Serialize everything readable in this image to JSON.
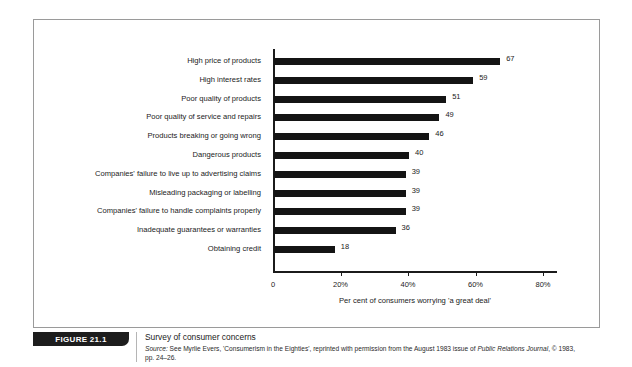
{
  "figure": {
    "badge_label": "FIGURE 21.1",
    "title": "Survey of consumer concerns",
    "source_prefix": "Source:",
    "source_text_1": " See Myrlie Evers, 'Consumerism in the Eighties', reprinted with permission from the August 1983 issue of ",
    "source_italic_journal": "Public Relations Journal",
    "source_text_2": ", © 1983,",
    "source_text_3": "pp. 24–26."
  },
  "chart_data": {
    "type": "bar",
    "orientation": "horizontal",
    "title": "Survey of consumer concerns",
    "xlabel": "Per cent of consumers worrying 'a great deal'",
    "ylabel": "",
    "xlim": [
      0,
      84
    ],
    "grid": false,
    "legend": false,
    "bar_color": "#141414",
    "axis_color": "#1b1b1b",
    "xticks": [
      0,
      20,
      40,
      60,
      80
    ],
    "xtick_labels": [
      "0",
      "20%",
      "40%",
      "60%",
      "80%"
    ],
    "categories": [
      "High price of products",
      "High interest rates",
      "Poor quality of products",
      "Poor quality of service and repairs",
      "Products breaking or going wrong",
      "Dangerous products",
      "Companies' failure to live up to advertising claims",
      "Misleading packaging or labelling",
      "Companies' failure to handle complaints properly",
      "Inadequate guarantees or warranties",
      "Obtaining credit"
    ],
    "values": [
      67,
      59,
      51,
      49,
      46,
      40,
      39,
      39,
      39,
      36,
      18
    ],
    "value_labels": [
      "67",
      "59",
      "51",
      "49",
      "46",
      "40",
      "39",
      "39",
      "39",
      "36",
      "18"
    ]
  }
}
